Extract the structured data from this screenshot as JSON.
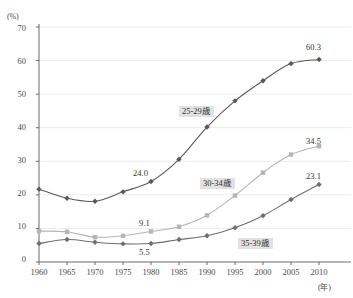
{
  "chart_data": {
    "type": "line",
    "title": "",
    "xlabel": "(年)",
    "ylabel": "(%)",
    "x": [
      1960,
      1965,
      1970,
      1975,
      1980,
      1985,
      1990,
      1995,
      2000,
      2005,
      2010
    ],
    "xlim": [
      1960,
      2010
    ],
    "ylim": [
      0,
      70
    ],
    "yticks": [
      0,
      10,
      20,
      30,
      40,
      50,
      60,
      70
    ],
    "grid": "horizontal",
    "legend": "inline-annotations",
    "series": [
      {
        "name": "25-29歳",
        "color": "#595959",
        "marker": "diamond",
        "values": [
          21.7,
          19.0,
          18.1,
          20.9,
          24.0,
          30.6,
          40.2,
          48.0,
          54.0,
          59.1,
          60.3
        ],
        "annotations": [
          {
            "x": 1980,
            "value": 24.0,
            "text": "24.0"
          },
          {
            "x": 2010,
            "value": 60.3,
            "text": "60.3"
          }
        ]
      },
      {
        "name": "30-34歳",
        "color": "#b5b5b5",
        "marker": "square",
        "values": [
          9.2,
          9.0,
          7.4,
          7.8,
          9.1,
          10.5,
          13.9,
          19.8,
          26.6,
          32.0,
          34.5
        ],
        "annotations": [
          {
            "x": 1980,
            "value": 9.1,
            "text": "9.1"
          },
          {
            "x": 2010,
            "value": 34.5,
            "text": "34.5"
          }
        ]
      },
      {
        "name": "35-39歳",
        "color": "#6e6e6e",
        "marker": "diamond",
        "values": [
          5.5,
          6.7,
          5.9,
          5.4,
          5.5,
          6.7,
          7.8,
          10.2,
          13.8,
          18.6,
          23.1
        ],
        "annotations": [
          {
            "x": 1980,
            "value": 5.5,
            "text": "5.5"
          },
          {
            "x": 2010,
            "value": 23.1,
            "text": "23.1"
          }
        ]
      }
    ]
  },
  "axes": {
    "y_unit": "(%)",
    "x_unit": "(年)",
    "y_tick_labels": [
      "70",
      "60",
      "50",
      "40",
      "30",
      "20",
      "10",
      "0"
    ],
    "x_tick_labels": [
      "1960",
      "1965",
      "1970",
      "1975",
      "1980",
      "1985",
      "1990",
      "1995",
      "2000",
      "2005",
      "2010"
    ]
  },
  "series_labels": [
    {
      "text": "25-29歳"
    },
    {
      "text": "30-34歳"
    },
    {
      "text": "35-39歳"
    }
  ],
  "value_labels": [
    {
      "text": "24.0"
    },
    {
      "text": "60.3"
    },
    {
      "text": "9.1"
    },
    {
      "text": "34.5"
    },
    {
      "text": "5.5"
    },
    {
      "text": "23.1"
    }
  ],
  "colors": {
    "axis": "#6b6b6b",
    "gridline": "#f2e9e9",
    "series_25_29": "#595959",
    "series_30_34": "#b5b5b5",
    "series_35_39": "#6e6e6e",
    "background": "#ffffff"
  }
}
